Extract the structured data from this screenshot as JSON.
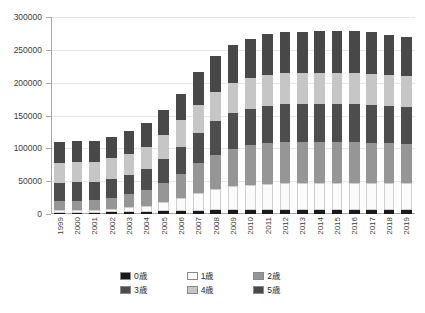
{
  "chart_data": {
    "type": "bar",
    "stacked": true,
    "title": "",
    "xlabel": "",
    "ylabel": "",
    "grid": true,
    "legend_position": "bottom",
    "ylim": [
      0,
      300000
    ],
    "ytick_labels": [
      "0",
      "50000",
      "100000",
      "150000",
      "200000",
      "250000",
      "300000"
    ],
    "ytick_values": [
      0,
      50000,
      100000,
      150000,
      200000,
      250000,
      300000
    ],
    "categories": [
      "1999",
      "2000",
      "2001",
      "2002",
      "2003",
      "2004",
      "2005",
      "2006",
      "2007",
      "2008",
      "2009",
      "2010",
      "2011",
      "2012",
      "2013",
      "2014",
      "2015",
      "2016",
      "2017",
      "2018",
      "2019"
    ],
    "series": [
      {
        "name": "0歳",
        "color": "#1a1a1a",
        "values": [
          2000,
          2000,
          2000,
          2500,
          3000,
          3500,
          4000,
          4500,
          5000,
          5500,
          5500,
          5500,
          5500,
          5500,
          5500,
          5500,
          5500,
          5500,
          5500,
          5500,
          5500
        ]
      },
      {
        "name": "1歳",
        "color": "#fbfbfb",
        "values": [
          4000,
          4000,
          4500,
          5500,
          7000,
          9000,
          14000,
          20000,
          27000,
          33000,
          37000,
          39000,
          40000,
          41000,
          41000,
          41000,
          41000,
          41000,
          41000,
          41000,
          41000
        ]
      },
      {
        "name": "2歳",
        "color": "#969696",
        "values": [
          14000,
          14500,
          15000,
          17000,
          20000,
          24000,
          30000,
          37000,
          45000,
          52000,
          57000,
          60000,
          62000,
          63000,
          63000,
          63000,
          63000,
          63000,
          62000,
          61000,
          60000
        ]
      },
      {
        "name": "3歳",
        "color": "#4d4d4d",
        "values": [
          28000,
          28000,
          28000,
          29000,
          30000,
          32000,
          36000,
          41000,
          46000,
          51000,
          54000,
          56000,
          57000,
          58000,
          58000,
          58000,
          58000,
          58000,
          58000,
          57000,
          57000
        ]
      },
      {
        "name": "4歳",
        "color": "#c6c6c6",
        "values": [
          30000,
          30000,
          30000,
          31000,
          32000,
          34000,
          37000,
          40000,
          43000,
          45000,
          46000,
          46500,
          47000,
          47000,
          47000,
          47000,
          47000,
          47000,
          47000,
          46500,
          46000
        ]
      },
      {
        "name": "5歳",
        "color": "#484848",
        "values": [
          32000,
          32000,
          32000,
          33000,
          34000,
          36000,
          38000,
          41000,
          50000,
          54000,
          58000,
          60000,
          62000,
          62500,
          63000,
          63500,
          63500,
          63500,
          63500,
          62000,
          59500
        ]
      }
    ]
  },
  "legend": {
    "items": [
      {
        "label": "0歳",
        "color": "#1a1a1a"
      },
      {
        "label": "1歳",
        "color": "#fbfbfb"
      },
      {
        "label": "2歳",
        "color": "#969696"
      },
      {
        "label": "3歳",
        "color": "#4d4d4d"
      },
      {
        "label": "4歳",
        "color": "#c6c6c6"
      },
      {
        "label": "5歳",
        "color": "#484848"
      }
    ]
  }
}
